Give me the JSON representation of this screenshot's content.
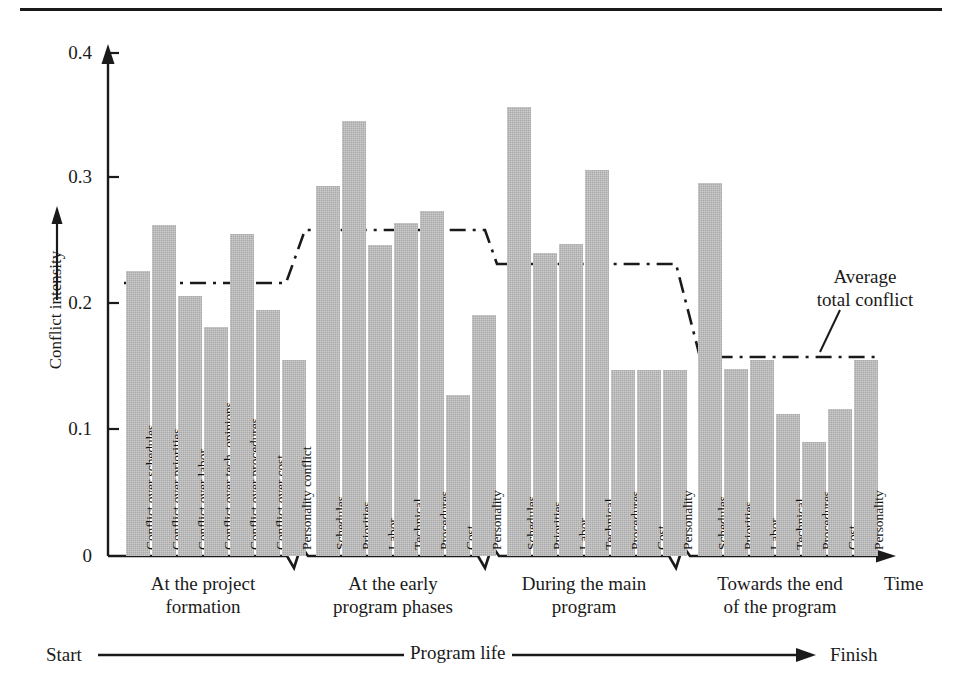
{
  "chart_data": {
    "type": "bar",
    "title": "",
    "xlabel": "Time",
    "ylabel": "Conflict intensity",
    "ylim": [
      0,
      0.4
    ],
    "ytick_labels": [
      "0",
      "0.1",
      "0.2",
      "0.3",
      "0.4"
    ],
    "ytick_values": [
      0,
      0.1,
      0.2,
      0.3,
      0.4
    ],
    "grid": false,
    "legend_position": "annotation",
    "annotations": [
      "Average total conflict"
    ],
    "axis_flow": {
      "start": "Start",
      "middle": "Program life",
      "finish": "Finish"
    },
    "groups": [
      {
        "caption_line1": "At the project",
        "caption_line2": "formation",
        "categories": [
          "Conflict over schedules",
          "Conflict over priorities",
          "Conflict over labor",
          "Conflict over tech. opinions",
          "Conflict over procedures",
          "Conflict over cost",
          "Personality conflict"
        ],
        "values": [
          0.227,
          0.263,
          0.207,
          0.182,
          0.256,
          0.196,
          0.156
        ],
        "average_total_conflict": 0.217
      },
      {
        "caption_line1": "At the early",
        "caption_line2": "program phases",
        "categories": [
          "Schedules",
          "Priorities",
          "Labor",
          "Technical",
          "Procedures",
          "Cost",
          "Personality"
        ],
        "values": [
          0.294,
          0.346,
          0.247,
          0.265,
          0.274,
          0.128,
          0.192
        ],
        "average_total_conflict": 0.259
      },
      {
        "caption_line1": "During the main",
        "caption_line2": "program",
        "categories": [
          "Schedules",
          "Priorities",
          "Labor",
          "Technical",
          "Procedures",
          "Cost",
          "Personality"
        ],
        "values": [
          0.357,
          0.241,
          0.248,
          0.307,
          0.148,
          0.148,
          0.148
        ],
        "average_total_conflict": 0.232
      },
      {
        "caption_line1": "Towards the end",
        "caption_line2": "of the program",
        "categories": [
          "Schedules",
          "Priorities",
          "Labor",
          "Technical",
          "Procedures",
          "Cost",
          "Personality"
        ],
        "values": [
          0.297,
          0.149,
          0.156,
          0.113,
          0.091,
          0.117,
          0.156
        ],
        "average_total_conflict": 0.16
      }
    ],
    "average_line_label": "Average total conflict",
    "colors": {
      "bar_fill": "#a9a9a9",
      "axis": "#1a1a1a",
      "average_line": "#1a1a1a"
    }
  }
}
